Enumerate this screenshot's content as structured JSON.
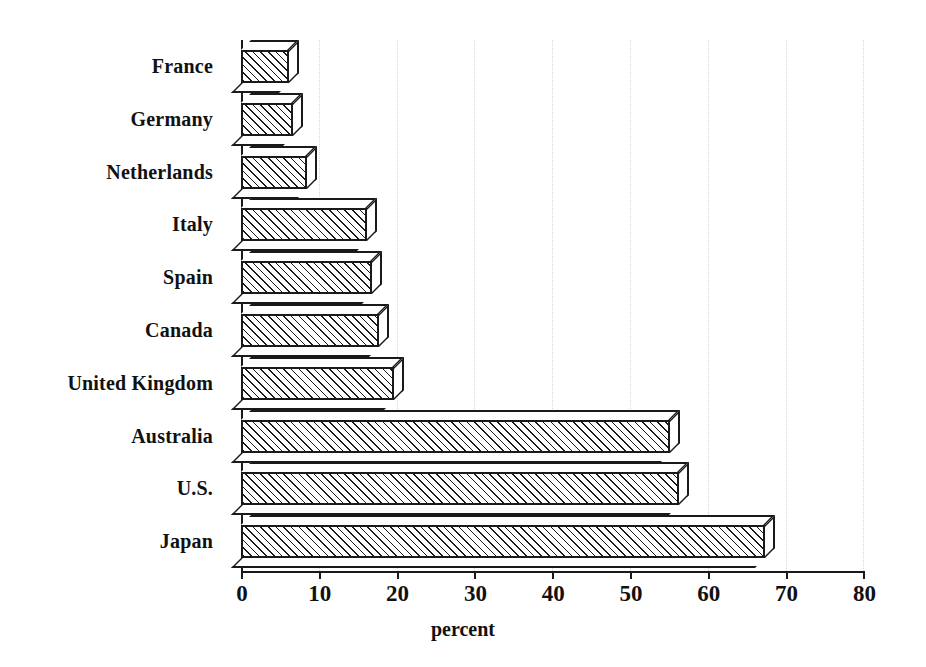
{
  "chart_data": {
    "type": "bar",
    "orientation": "horizontal",
    "title": "",
    "xlabel": "percent",
    "ylabel": "",
    "xlim": [
      0,
      80
    ],
    "xticks": [
      0,
      10,
      20,
      30,
      40,
      50,
      60,
      70,
      80
    ],
    "tick_labels": [
      "0",
      "10",
      "20",
      "30",
      "40",
      "50",
      "60",
      "70",
      "80"
    ],
    "grid": "vertical dotted gridlines at each x tick",
    "legend": "none",
    "style": "3D isometric hatched bars, black on white",
    "categories": [
      "France",
      "Germany",
      "Netherlands",
      "Italy",
      "Spain",
      "Canada",
      "United Kingdom",
      "Australia",
      "U.S.",
      "Japan"
    ],
    "values": [
      6.2,
      6.7,
      8.5,
      16.2,
      16.8,
      17.8,
      19.7,
      55.2,
      56.3,
      67.3
    ],
    "bars": [
      {
        "label": "France",
        "value": 6.2
      },
      {
        "label": "Germany",
        "value": 6.7
      },
      {
        "label": "Netherlands",
        "value": 8.5
      },
      {
        "label": "Italy",
        "value": 16.2
      },
      {
        "label": "Spain",
        "value": 16.8
      },
      {
        "label": "Canada",
        "value": 17.8
      },
      {
        "label": "United Kingdom",
        "value": 19.7
      },
      {
        "label": "Australia",
        "value": 55.2
      },
      {
        "label": "U.S.",
        "value": 56.3
      },
      {
        "label": "Japan",
        "value": 67.3
      }
    ],
    "colors": {
      "ink": "#1a1a1a",
      "background": "#ffffff",
      "gridline": "#d8d8d8"
    }
  },
  "geometry": {
    "origin_x": 241,
    "px_per_unit": 7.78,
    "first_bar_top": 40,
    "bar_pitch": 52.8,
    "depth": 10
  }
}
